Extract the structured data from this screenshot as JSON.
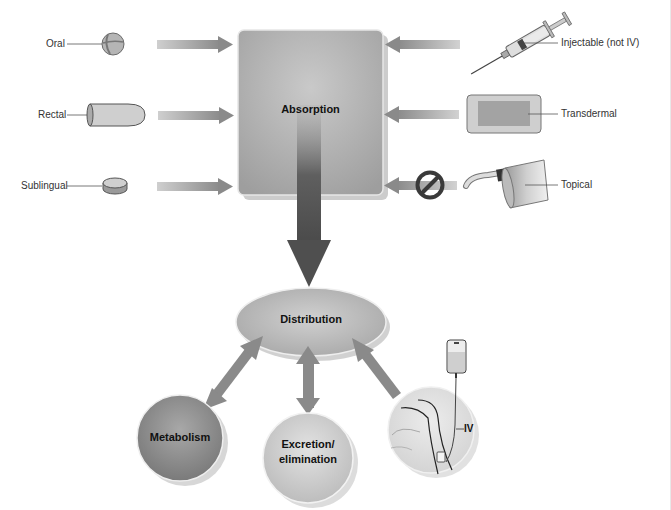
{
  "diagram": {
    "central_nodes": {
      "absorption": "Absorption",
      "distribution": "Distribution",
      "metabolism": "Metabolism",
      "excretion_line1": "Excretion/",
      "excretion_line2": "elimination"
    },
    "left_routes": [
      {
        "label": "Oral",
        "icon": "pill-tablet-icon"
      },
      {
        "label": "Rectal",
        "icon": "suppository-icon"
      },
      {
        "label": "Sublingual",
        "icon": "sublingual-tablet-icon"
      }
    ],
    "right_routes": [
      {
        "label": "Injectable (not IV)",
        "icon": "syringe-icon"
      },
      {
        "label": "Transdermal",
        "icon": "patch-icon"
      },
      {
        "label": "Topical",
        "icon": "ointment-tube-icon",
        "blocked": true
      }
    ],
    "iv": {
      "label": "IV",
      "icon": "iv-drip-arm-icon"
    },
    "colors": {
      "arrow": "#8a8a8a",
      "arrow_dark": "#555555",
      "box": "#b0b0b0",
      "ellipse": "#b8b8b8",
      "metabolism": "#8e8e8e",
      "excretion": "#c8c8c8",
      "no_symbol": "#3a3a3a"
    }
  }
}
